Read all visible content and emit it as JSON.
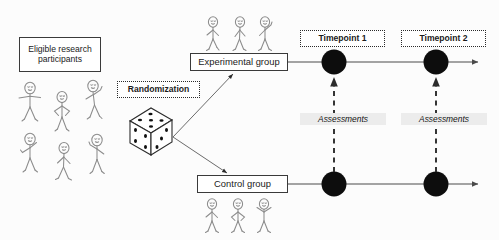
{
  "diagram": {
    "type": "flow-diagram",
    "background_color": "#fcfcfc",
    "line_color": "#4a4a4a",
    "node_color": "#0d0d0d",
    "highlight_color": "#ececec"
  },
  "boxes": {
    "eligible": {
      "label": "Eligible research participants",
      "style": "solid"
    },
    "randomization": {
      "label": "Randomization",
      "style": "dotted"
    },
    "experimental": {
      "label": "Experimental group",
      "style": "solid"
    },
    "control": {
      "label": "Control group",
      "style": "solid"
    },
    "timepoint1": {
      "label": "Timepoint 1",
      "style": "dotted"
    },
    "timepoint2": {
      "label": "Timepoint 2",
      "style": "dotted"
    }
  },
  "labels": {
    "assessment1": "Assessments",
    "assessment2": "Assessments"
  },
  "icons": {
    "die": {
      "name": "die-icon",
      "top_face_pips": 5,
      "left_face_pips": 4,
      "right_face_pips": 3
    },
    "participant_cluster": {
      "name": "stick-figure-group-icon",
      "count": 6
    },
    "experimental_cluster": {
      "name": "stick-figure-group-icon",
      "count": 3
    },
    "control_cluster": {
      "name": "stick-figure-group-icon",
      "count": 3
    }
  },
  "timelines": [
    {
      "name": "experimental-timeline",
      "y": 62,
      "node_x": [
        334,
        436
      ]
    },
    {
      "name": "control-timeline",
      "y": 184,
      "node_x": [
        334,
        436
      ]
    }
  ]
}
